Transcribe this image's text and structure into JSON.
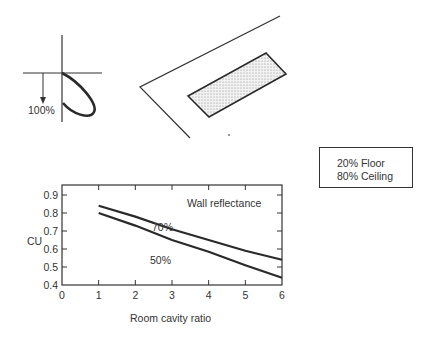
{
  "polar_diagram": {
    "label": "100%"
  },
  "reflectance_box": {
    "lines": [
      "20% Floor",
      "80% Ceiling"
    ]
  },
  "chart_data": {
    "type": "line",
    "title": "",
    "xlabel": "Room cavity ratio",
    "ylabel": "CU",
    "xlim": [
      0,
      6
    ],
    "ylim": [
      0.4,
      0.9
    ],
    "x_ticks": [
      "0",
      "1",
      "2",
      "3",
      "4",
      "5",
      "6"
    ],
    "y_ticks": [
      "0.4",
      "0.5",
      "0.6",
      "0.7",
      "0.8",
      "0.9"
    ],
    "legend_title": "Wall reflectance",
    "grid": false,
    "x": [
      1,
      2,
      3,
      4,
      5,
      6
    ],
    "series": [
      {
        "name": "70%",
        "values": [
          0.84,
          0.78,
          0.71,
          0.65,
          0.59,
          0.54
        ]
      },
      {
        "name": "50%",
        "values": [
          0.8,
          0.73,
          0.65,
          0.585,
          0.51,
          0.44
        ]
      }
    ]
  }
}
